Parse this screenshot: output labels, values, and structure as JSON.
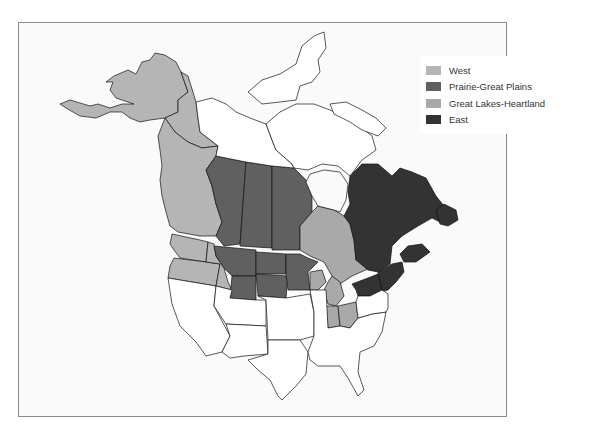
{
  "map": {
    "title": "",
    "legend": [
      {
        "id": "west",
        "label": "West",
        "color": "#b5b5b5"
      },
      {
        "id": "prairie",
        "label": "Prairie-Great Plains",
        "color": "#606060"
      },
      {
        "id": "great_lakes",
        "label": "Great Lakes-Heartland",
        "color": "#a9a9a9"
      },
      {
        "id": "east",
        "label": "East",
        "color": "#333333"
      }
    ],
    "unshaded_color": "#ffffff",
    "regions": {
      "west": [
        "Alaska",
        "Yukon",
        "British Columbia",
        "Washington",
        "Oregon",
        "Idaho"
      ],
      "prairie": [
        "Alberta",
        "Saskatchewan",
        "Manitoba",
        "Montana",
        "North Dakota",
        "South Dakota",
        "Wyoming",
        "Minnesota"
      ],
      "great_lakes": [
        "Ontario",
        "Michigan",
        "Indiana",
        "Ohio",
        "Wisconsin (partial)"
      ],
      "east": [
        "Quebec",
        "Newfoundland and Labrador",
        "New Brunswick",
        "Nova Scotia",
        "Prince Edward Island",
        "Maine",
        "New Hampshire",
        "Vermont",
        "New York"
      ]
    }
  }
}
